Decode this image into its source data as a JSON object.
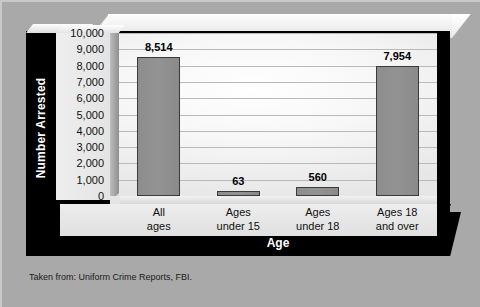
{
  "chart_data": {
    "type": "bar",
    "title": "",
    "xlabel": "Age",
    "ylabel": "Number Arrested",
    "categories": [
      "All ages",
      "Ages under 15",
      "Ages under 18",
      "Ages 18 and over"
    ],
    "category_lines": [
      [
        "All",
        "ages"
      ],
      [
        "Ages",
        "under 15"
      ],
      [
        "Ages",
        "under 18"
      ],
      [
        "Ages 18",
        "and over"
      ]
    ],
    "values": [
      8514,
      63,
      560,
      7954
    ],
    "value_labels": [
      "8,514",
      "63",
      "560",
      "7,954"
    ],
    "ylim": [
      0,
      10000
    ],
    "ytick_step": 1000,
    "yticks": [
      10000,
      9000,
      8000,
      7000,
      6000,
      5000,
      4000,
      3000,
      2000,
      1000,
      0
    ],
    "ytick_labels": [
      "10,000",
      "9,000",
      "8,000",
      "7,000",
      "6,000",
      "5,000",
      "4,000",
      "3,000",
      "2,000",
      "1,000",
      "0"
    ],
    "grid": true,
    "legend": "none",
    "bar_color": "#8e8e8e",
    "bar_edge_color": "#3a3a3a"
  },
  "caption": {
    "source_note": "Taken from: Uniform Crime Reports, FBI."
  },
  "colors": {
    "page_background": "#a9a9a9",
    "frame_black": "#000000",
    "plot_background": "#f4f4f4",
    "axis_text": "#ffffff"
  }
}
